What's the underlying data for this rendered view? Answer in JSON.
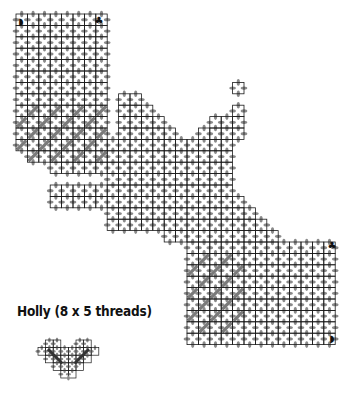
{
  "figure": {
    "caption": "Holly (8 x 5 threads)",
    "colors": {
      "grid_line": "#1a1a1a",
      "stitch": "#8a8a8a",
      "diagonal_fill": "#7a7a7a",
      "marker": "#111111",
      "background": "#ffffff"
    },
    "markers": [
      {
        "name": "half-circle-marker-top-left",
        "glyph": "◗",
        "x": 21,
        "y": 25
      },
      {
        "name": "club-marker-top-right",
        "glyph": "♣",
        "x": 99,
        "y": 24
      },
      {
        "name": "club-marker-bottom-right",
        "glyph": "♣",
        "x": 332,
        "y": 249
      },
      {
        "name": "half-circle-marker-bottom-right",
        "glyph": "◗",
        "x": 332,
        "y": 342
      }
    ]
  },
  "chart_data": {
    "type": "diagram",
    "title": "Holly (8 x 5 threads)",
    "grid": {
      "origin_x": 16,
      "origin_y": 14,
      "cell": 11.4
    },
    "band_rows": [
      [
        0,
        0,
        8
      ],
      [
        1,
        0,
        8
      ],
      [
        2,
        0,
        8
      ],
      [
        3,
        0,
        8
      ],
      [
        4,
        0,
        8
      ],
      [
        5,
        0,
        8
      ],
      [
        6,
        0,
        8
      ],
      [
        7,
        0,
        8
      ],
      [
        8,
        0,
        8
      ],
      [
        9,
        0,
        8
      ],
      [
        10,
        0,
        8
      ],
      [
        11,
        0,
        8
      ],
      [
        12,
        1,
        8
      ],
      [
        13,
        3,
        8
      ],
      [
        7,
        9,
        11
      ],
      [
        8,
        9,
        12
      ],
      [
        9,
        9,
        13
      ],
      [
        10,
        9,
        14
      ],
      [
        11,
        8,
        19
      ],
      [
        12,
        8,
        19
      ],
      [
        13,
        8,
        19
      ],
      [
        14,
        8,
        19
      ],
      [
        15,
        3,
        19
      ],
      [
        16,
        3,
        20
      ],
      [
        17,
        8,
        21
      ],
      [
        18,
        8,
        22
      ],
      [
        19,
        13,
        23
      ],
      [
        20,
        15,
        28
      ],
      [
        21,
        15,
        28
      ],
      [
        22,
        15,
        28
      ],
      [
        23,
        15,
        28
      ],
      [
        24,
        15,
        28
      ],
      [
        25,
        15,
        28
      ],
      [
        26,
        15,
        28
      ],
      [
        27,
        15,
        28
      ],
      [
        28,
        15,
        28
      ],
      [
        8,
        19,
        20
      ],
      [
        9,
        17,
        20
      ],
      [
        10,
        16,
        20
      ],
      [
        6,
        19,
        20
      ]
    ],
    "diagonal_blocks": [
      {
        "row_start": 8,
        "row_end": 13,
        "col_start": 0,
        "col_end": 8
      },
      {
        "row_start": 21,
        "row_end": 28,
        "col_start": 15,
        "col_end": 20
      }
    ],
    "holly_motif": {
      "origin_x": 38,
      "origin_y": 340,
      "cell": 7.6,
      "cols": 8,
      "rows": 5
    }
  }
}
